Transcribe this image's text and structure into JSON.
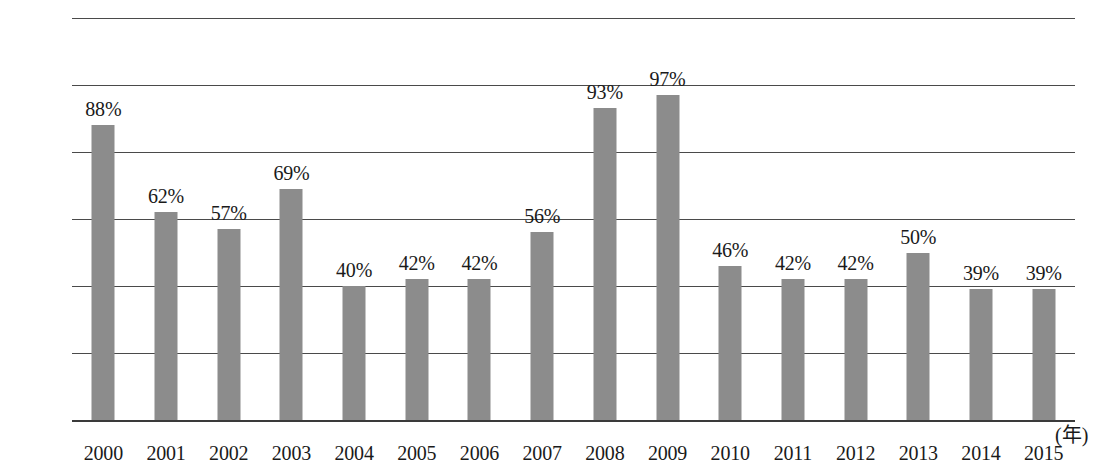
{
  "chart_data": {
    "type": "bar",
    "title": "",
    "subtitle": "",
    "xlabel": "(年)",
    "ylabel": "",
    "categories": [
      "2000",
      "2001",
      "2002",
      "2003",
      "2004",
      "2005",
      "2006",
      "2007",
      "2008",
      "2009",
      "2010",
      "2011",
      "2012",
      "2013",
      "2014",
      "2015"
    ],
    "values": [
      88,
      62,
      57,
      69,
      40,
      42,
      42,
      56,
      93,
      97,
      46,
      42,
      42,
      50,
      39,
      39
    ],
    "value_labels": [
      "88%",
      "62%",
      "57%",
      "69%",
      "40%",
      "42%",
      "42%",
      "56%",
      "93%",
      "97%",
      "46%",
      "42%",
      "42%",
      "50%",
      "39%",
      "39%"
    ],
    "ylim": [
      0,
      120
    ],
    "y_ticks": [
      0,
      20,
      40,
      60,
      80,
      100,
      120
    ],
    "y_tick_labels": [
      "0%",
      "20%",
      "40%",
      "60%",
      "80%",
      "100%",
      "120%"
    ],
    "grid": true,
    "legend": false,
    "legend_position": "none",
    "series": [
      {
        "name": "",
        "color": "#8c8c8c",
        "values": [
          88,
          62,
          57,
          69,
          40,
          42,
          42,
          56,
          93,
          97,
          46,
          42,
          42,
          50,
          39,
          39
        ]
      }
    ],
    "colors": {
      "bar": "#8c8c8c",
      "gridline": "#4a4a4a",
      "baseline": "#3a3a3a",
      "text": "#1a1a1a",
      "background": "#ffffff"
    }
  }
}
